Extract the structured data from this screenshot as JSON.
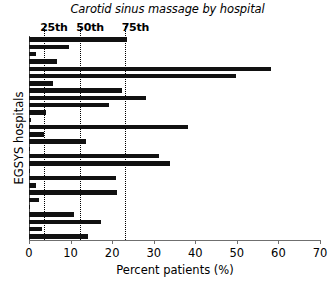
{
  "chart_data": {
    "type": "bar",
    "orientation": "horizontal",
    "title": "Carotid sinus massage by hospital",
    "xlabel": "Percent patients (%)",
    "ylabel": "EGSYS hospitals",
    "xlim": [
      0,
      70
    ],
    "xticks": [
      0,
      10,
      20,
      30,
      40,
      50,
      60,
      70
    ],
    "xtick_labels": [
      "0",
      "10",
      "20",
      "30",
      "40",
      "50",
      "60",
      "70"
    ],
    "grid": false,
    "legend": "none",
    "categories": [
      "hospital-1",
      "hospital-2",
      "hospital-3",
      "hospital-4",
      "hospital-5",
      "hospital-6",
      "hospital-7",
      "hospital-8",
      "hospital-9",
      "hospital-10",
      "hospital-11",
      "hospital-12",
      "hospital-13",
      "hospital-14",
      "hospital-15",
      "hospital-16",
      "hospital-17",
      "hospital-18",
      "hospital-19",
      "hospital-20",
      "hospital-21",
      "hospital-22",
      "hospital-23",
      "hospital-24"
    ],
    "values": [
      23.5,
      9.7,
      1.8,
      6.7,
      58.3,
      49.8,
      5.7,
      22.3,
      28.2,
      19.2,
      4.2,
      0.4,
      38.2,
      3.5,
      13.6,
      0.3,
      31.3,
      33.8,
      0.3,
      21.0,
      1.6,
      21.2,
      2.4,
      0.2
    ],
    "annotations": [
      {
        "label": "25th",
        "value": 3.6
      },
      {
        "label": "50th",
        "value": 12.3
      },
      {
        "label": "75th",
        "value": 23.2
      }
    ],
    "bar_color": "#111111",
    "reference_line_style": "dotted"
  },
  "extra_bars": [
    10.9,
    17.4,
    3.1,
    14.2
  ]
}
